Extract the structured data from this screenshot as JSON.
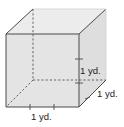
{
  "diagram": {
    "shape": "cube",
    "colors": {
      "front_face": "#e2e2e2",
      "top_face": "#ebebeb",
      "side_face": "#dcdcdc",
      "edge": "#4a4a4a",
      "hidden_edge": "#555555"
    },
    "labels": {
      "height": "1 yd.",
      "depth": "1 yd.",
      "width": "1 yd."
    }
  }
}
